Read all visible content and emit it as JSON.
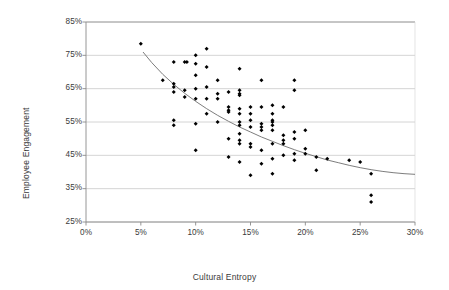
{
  "chart_data": {
    "type": "scatter",
    "title": "",
    "xlabel": "Cultural Entropy",
    "ylabel": "Employee Engagement",
    "xlim": [
      0,
      30
    ],
    "ylim": [
      25,
      85
    ],
    "xticks": [
      "0%",
      "5%",
      "10%",
      "15%",
      "20%",
      "25%",
      "30%"
    ],
    "yticks": [
      "25%",
      "35%",
      "45%",
      "55%",
      "65%",
      "75%",
      "85%"
    ],
    "xtick_values": [
      0,
      5,
      10,
      15,
      20,
      25,
      30
    ],
    "ytick_values": [
      25,
      35,
      45,
      55,
      65,
      75,
      85
    ],
    "grid": "horizontal",
    "legend": "none",
    "marker_color": "#000000",
    "gridline_color": "#c9c9c9",
    "border_color": "#9a9a9a",
    "trendline_color": "#6e6e6e",
    "series": [
      {
        "name": "Organizations",
        "points": [
          [
            5.0,
            78.5
          ],
          [
            7.0,
            67.5
          ],
          [
            8.0,
            73.0
          ],
          [
            8.0,
            66.5
          ],
          [
            8.0,
            65.5
          ],
          [
            8.0,
            64.0
          ],
          [
            8.0,
            55.5
          ],
          [
            8.0,
            54.0
          ],
          [
            9.0,
            73.0
          ],
          [
            9.2,
            73.0
          ],
          [
            9.0,
            64.5
          ],
          [
            9.0,
            62.5
          ],
          [
            10.0,
            75.0
          ],
          [
            10.0,
            72.5
          ],
          [
            10.0,
            69.0
          ],
          [
            10.0,
            65.0
          ],
          [
            10.0,
            62.0
          ],
          [
            10.0,
            54.5
          ],
          [
            10.0,
            46.5
          ],
          [
            11.0,
            77.0
          ],
          [
            11.0,
            71.5
          ],
          [
            11.0,
            65.5
          ],
          [
            11.0,
            62.0
          ],
          [
            11.0,
            57.5
          ],
          [
            12.0,
            67.5
          ],
          [
            12.0,
            63.5
          ],
          [
            12.0,
            62.0
          ],
          [
            12.0,
            55.0
          ],
          [
            13.0,
            64.0
          ],
          [
            13.0,
            59.5
          ],
          [
            13.0,
            58.5
          ],
          [
            13.0,
            58.0
          ],
          [
            13.0,
            50.0
          ],
          [
            13.0,
            44.5
          ],
          [
            14.0,
            71.0
          ],
          [
            14.0,
            64.5
          ],
          [
            14.0,
            63.5
          ],
          [
            14.0,
            63.0
          ],
          [
            14.0,
            59.0
          ],
          [
            14.0,
            57.5
          ],
          [
            14.0,
            55.0
          ],
          [
            14.0,
            54.0
          ],
          [
            14.0,
            51.5
          ],
          [
            14.0,
            49.5
          ],
          [
            14.0,
            48.5
          ],
          [
            14.0,
            43.0
          ],
          [
            15.0,
            59.5
          ],
          [
            15.0,
            57.5
          ],
          [
            15.0,
            55.5
          ],
          [
            15.0,
            53.5
          ],
          [
            15.0,
            48.5
          ],
          [
            15.0,
            47.5
          ],
          [
            15.0,
            39.0
          ],
          [
            16.0,
            67.5
          ],
          [
            16.0,
            59.5
          ],
          [
            16.0,
            54.5
          ],
          [
            16.0,
            53.5
          ],
          [
            16.0,
            52.5
          ],
          [
            16.0,
            46.5
          ],
          [
            16.0,
            42.5
          ],
          [
            17.0,
            60.0
          ],
          [
            17.0,
            57.5
          ],
          [
            17.0,
            55.5
          ],
          [
            17.0,
            55.0
          ],
          [
            17.0,
            54.0
          ],
          [
            17.0,
            52.5
          ],
          [
            17.0,
            48.5
          ],
          [
            17.0,
            44.0
          ],
          [
            17.0,
            39.5
          ],
          [
            18.0,
            59.5
          ],
          [
            18.0,
            51.0
          ],
          [
            18.0,
            49.5
          ],
          [
            18.0,
            48.5
          ],
          [
            18.0,
            45.0
          ],
          [
            19.0,
            67.5
          ],
          [
            19.0,
            64.5
          ],
          [
            19.0,
            52.0
          ],
          [
            19.0,
            50.0
          ],
          [
            19.0,
            45.5
          ],
          [
            19.0,
            43.5
          ],
          [
            20.0,
            52.5
          ],
          [
            20.0,
            47.0
          ],
          [
            20.0,
            45.5
          ],
          [
            21.0,
            44.5
          ],
          [
            21.0,
            40.5
          ],
          [
            22.0,
            44.0
          ],
          [
            24.0,
            43.5
          ],
          [
            25.0,
            43.0
          ],
          [
            26.0,
            39.5
          ],
          [
            26.0,
            33.0
          ],
          [
            26.0,
            31.0
          ]
        ]
      }
    ],
    "trendline": {
      "type": "power",
      "description": "Decreasing power-law fit",
      "points": [
        [
          5.2,
          76.0
        ],
        [
          6.0,
          72.8
        ],
        [
          7.0,
          69.3
        ],
        [
          8.0,
          66.3
        ],
        [
          9.0,
          63.6
        ],
        [
          10.0,
          61.2
        ],
        [
          11.0,
          59.0
        ],
        [
          12.0,
          57.0
        ],
        [
          13.0,
          55.2
        ],
        [
          14.0,
          53.5
        ],
        [
          15.0,
          52.0
        ],
        [
          16.0,
          50.5
        ],
        [
          17.0,
          49.2
        ],
        [
          18.0,
          47.9
        ],
        [
          19.0,
          46.7
        ],
        [
          20.0,
          45.6
        ],
        [
          21.0,
          44.6
        ],
        [
          22.0,
          43.6
        ],
        [
          23.0,
          42.8
        ],
        [
          24.0,
          42.0
        ],
        [
          25.0,
          41.3
        ],
        [
          26.0,
          40.7
        ],
        [
          27.0,
          40.2
        ],
        [
          28.0,
          39.8
        ],
        [
          29.0,
          39.5
        ],
        [
          30.0,
          39.3
        ]
      ]
    }
  }
}
